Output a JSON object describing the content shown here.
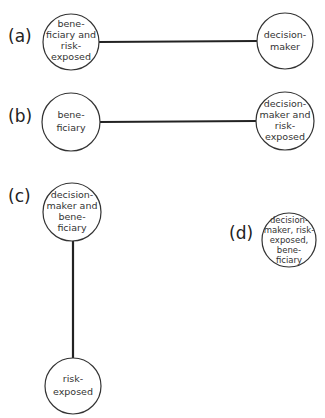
{
  "panels": [
    {
      "label": "(a)",
      "nodes": [
        {
          "lines": [
            "bene-",
            "ficiary and",
            "risk-",
            "exposed"
          ]
        },
        {
          "lines": [
            "decision-",
            "maker"
          ]
        }
      ],
      "edges": [
        [
          0,
          1
        ]
      ]
    },
    {
      "label": "(b)",
      "nodes": [
        {
          "lines": [
            "bene-",
            "ficiary"
          ]
        },
        {
          "lines": [
            "decision-",
            "maker and",
            "risk-",
            "exposed"
          ]
        }
      ],
      "edges": [
        [
          0,
          1
        ]
      ]
    },
    {
      "label": "(c)",
      "nodes": [
        {
          "lines": [
            "decision-",
            "maker and",
            "bene-",
            "ficiary"
          ]
        },
        {
          "lines": [
            "risk-",
            "exposed"
          ]
        }
      ],
      "edges": [
        [
          0,
          1
        ]
      ]
    },
    {
      "label": "(d)",
      "nodes": [
        {
          "lines": [
            "decision-",
            "maker, risk-",
            "exposed,",
            "bene-",
            "ficiary"
          ]
        }
      ],
      "edges": []
    }
  ]
}
